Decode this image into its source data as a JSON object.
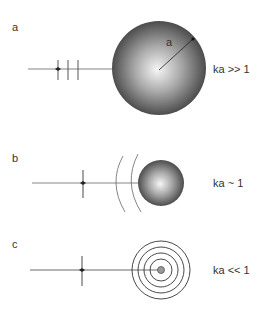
{
  "panels": [
    {
      "label": "a",
      "condition": "ka >> 1",
      "radius_label": "a"
    },
    {
      "label": "b",
      "condition": "ka ~ 1"
    },
    {
      "label": "c",
      "condition": "ka << 1"
    }
  ],
  "colors": {
    "line": "#555555",
    "sphere_light": "#f4f4f4",
    "sphere_dark": "#3a3a3a",
    "ring": "#333333"
  }
}
